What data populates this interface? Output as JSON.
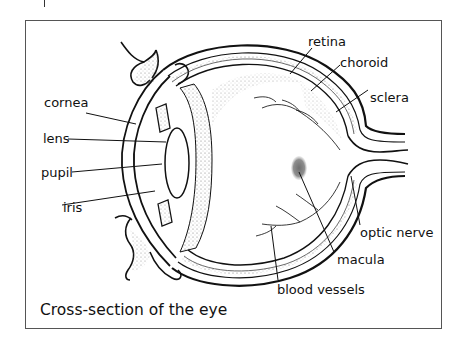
{
  "figure": {
    "caption": "Cross-section of the eye",
    "labels": {
      "retina": "retina",
      "choroid": "choroid",
      "sclera": "sclera",
      "cornea": "cornea",
      "lens": "lens",
      "pupil": "pupil",
      "iris": "iris",
      "optic_nerve": "optic nerve",
      "macula": "macula",
      "blood_vessels": "blood vessels"
    },
    "colors": {
      "line": "#111111",
      "frame": "#555555",
      "macula_fill": "#8a8a8a",
      "stipple": "#9a9a9a"
    }
  }
}
